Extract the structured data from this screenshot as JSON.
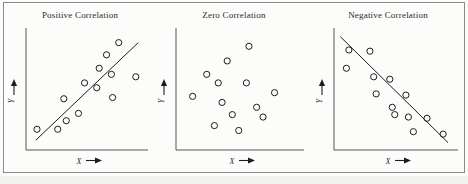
{
  "figure": {
    "background_color": "#fbfbfa",
    "frame_color": "#8a8a8a",
    "marker_color": "#1d1d1d",
    "line_color": "#1c1c1c",
    "axis_color": "#555555"
  },
  "axis_labels": {
    "x": "X",
    "y": "Y",
    "x_arrow_icon": "right-arrow-icon",
    "y_arrow_icon": "up-arrow-icon"
  },
  "chart_data": [
    {
      "type": "scatter",
      "title": "Positive Correlation",
      "xlabel": "X",
      "ylabel": "Y",
      "xlim": [
        0,
        100
      ],
      "ylim": [
        0,
        100
      ],
      "grid": false,
      "legend": "none",
      "trendline": {
        "shown": true,
        "x": [
          8,
          92
        ],
        "y": [
          8,
          88
        ]
      },
      "points": [
        {
          "x": 9,
          "y": 17
        },
        {
          "x": 26,
          "y": 17
        },
        {
          "x": 33,
          "y": 24
        },
        {
          "x": 31,
          "y": 42
        },
        {
          "x": 43,
          "y": 30
        },
        {
          "x": 48,
          "y": 55
        },
        {
          "x": 58,
          "y": 51
        },
        {
          "x": 60,
          "y": 67
        },
        {
          "x": 66,
          "y": 78
        },
        {
          "x": 70,
          "y": 62
        },
        {
          "x": 71,
          "y": 43
        },
        {
          "x": 76,
          "y": 88
        },
        {
          "x": 90,
          "y": 60
        }
      ]
    },
    {
      "type": "scatter",
      "title": "Zero Correlation",
      "xlabel": "X",
      "ylabel": "Y",
      "xlim": [
        0,
        100
      ],
      "ylim": [
        0,
        100
      ],
      "grid": false,
      "legend": "none",
      "trendline": {
        "shown": false
      },
      "points": [
        {
          "x": 13,
          "y": 44
        },
        {
          "x": 24,
          "y": 62
        },
        {
          "x": 30,
          "y": 20
        },
        {
          "x": 33,
          "y": 55
        },
        {
          "x": 36,
          "y": 39
        },
        {
          "x": 40,
          "y": 73
        },
        {
          "x": 44,
          "y": 29
        },
        {
          "x": 49,
          "y": 16
        },
        {
          "x": 55,
          "y": 55
        },
        {
          "x": 57,
          "y": 85
        },
        {
          "x": 63,
          "y": 35
        },
        {
          "x": 68,
          "y": 27
        },
        {
          "x": 77,
          "y": 47
        }
      ]
    },
    {
      "type": "scatter",
      "title": "Negative Correlation",
      "xlabel": "X",
      "ylabel": "Y",
      "xlim": [
        0,
        100
      ],
      "ylim": [
        0,
        100
      ],
      "grid": false,
      "legend": "none",
      "trendline": {
        "shown": true,
        "x": [
          5,
          92
        ],
        "y": [
          93,
          6
        ]
      },
      "points": [
        {
          "x": 12,
          "y": 82
        },
        {
          "x": 10,
          "y": 67
        },
        {
          "x": 29,
          "y": 81
        },
        {
          "x": 32,
          "y": 60
        },
        {
          "x": 34,
          "y": 46
        },
        {
          "x": 45,
          "y": 58
        },
        {
          "x": 47,
          "y": 35
        },
        {
          "x": 49,
          "y": 29
        },
        {
          "x": 58,
          "y": 45
        },
        {
          "x": 60,
          "y": 27
        },
        {
          "x": 64,
          "y": 15
        },
        {
          "x": 75,
          "y": 26
        },
        {
          "x": 88,
          "y": 13
        }
      ]
    }
  ]
}
